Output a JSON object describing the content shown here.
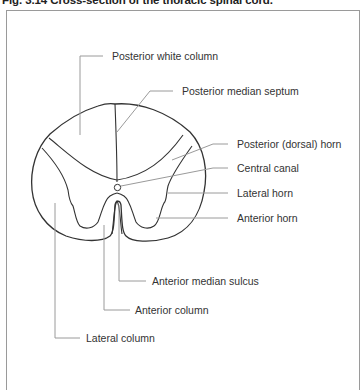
{
  "figure": {
    "title": "Fig. 3.14  Cross-section of the thoracic spinal cord."
  },
  "labels": {
    "posterior_white_column": "Posterior white column",
    "posterior_median_septum": "Posterior median septum",
    "posterior_dorsal_horn": "Posterior (dorsal) horn",
    "central_canal": "Central canal",
    "lateral_horn": "Lateral horn",
    "anterior_horn": "Anterior horn",
    "anterior_median_sulcus": "Anterior median sulcus",
    "anterior_column": "Anterior column",
    "lateral_column": "Lateral column"
  },
  "colors": {
    "outline": "#333333",
    "leader_line": "#9a9a9a",
    "frame": "#9a9a9a",
    "text": "#333333"
  }
}
